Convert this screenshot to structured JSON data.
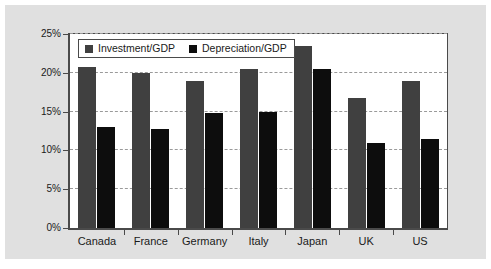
{
  "chart_data": {
    "type": "bar",
    "title": "",
    "subtitle": "",
    "xlabel": "",
    "ylabel": "",
    "categories": [
      "Canada",
      "France",
      "Germany",
      "Italy",
      "Japan",
      "UK",
      "US"
    ],
    "series": [
      {
        "name": "Investment/GDP",
        "color": "#404040",
        "values": [
          20.7,
          20.0,
          19.0,
          20.5,
          23.5,
          16.8,
          19.0
        ]
      },
      {
        "name": "Depreciation/GDP",
        "color": "#0d0d0d",
        "values": [
          13.0,
          12.8,
          14.8,
          15.0,
          20.5,
          11.0,
          11.5
        ]
      }
    ],
    "ylim": [
      0,
      25
    ],
    "ytick_values": [
      0,
      5,
      10,
      15,
      20,
      25
    ],
    "ytick_labels": [
      "0%",
      "5%",
      "10%",
      "15%",
      "20%",
      "25%"
    ],
    "grid": true,
    "grid_axis": "y",
    "legend": true,
    "legend_position": "upper-left-inside",
    "value_suffix": "%",
    "background_color": "#e0e0e0",
    "plot_background_color": "#ffffff",
    "axis_color": "#4a4a4a",
    "grid_color": "#9a9a9a"
  }
}
